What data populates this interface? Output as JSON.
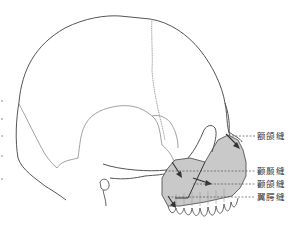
{
  "figure": {
    "fill_color": "#c9c9c9",
    "line_color": "#555555",
    "suture_color": "#8a8a8a",
    "labels": [
      {
        "text": "额颌缝",
        "x": 257,
        "y": 131
      },
      {
        "text": "颧颞缝",
        "x": 257,
        "y": 167
      },
      {
        "text": "颧颌缝",
        "x": 257,
        "y": 180
      },
      {
        "text": "翼腭缝",
        "x": 257,
        "y": 193
      }
    ]
  }
}
